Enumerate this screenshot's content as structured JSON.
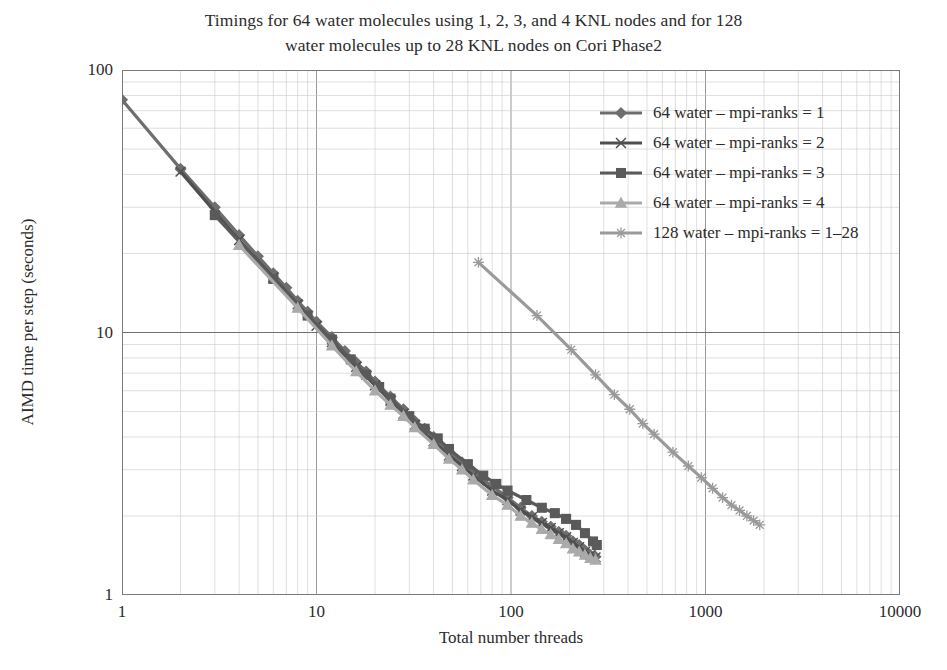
{
  "chart_data": {
    "type": "line",
    "title": "Timings for 64 water molecules using 1, 2, 3, and 4 KNL nodes and for 128 water molecules up to 28 KNL nodes on Cori Phase2",
    "title_line1": "Timings for 64 water molecules using 1, 2, 3, and 4 KNL nodes and for 128",
    "title_line2": "water molecules up to 28 KNL nodes on Cori Phase2",
    "xlabel": "Total number threads",
    "ylabel": "AIMD time per step (seconds)",
    "xscale": "log",
    "yscale": "log",
    "xlim": [
      1,
      10000
    ],
    "ylim": [
      1,
      100
    ],
    "xticks": [
      "1",
      "10",
      "100",
      "1000",
      "10000"
    ],
    "xtick_values": [
      1,
      10,
      100,
      1000,
      10000
    ],
    "yticks": [
      "1",
      "10",
      "100"
    ],
    "ytick_values": [
      1,
      10,
      100
    ],
    "grid": "major and minor gridlines on both axes",
    "legend_position": "upper right inside plot",
    "series": [
      {
        "name": "64 water – mpi-ranks = 1",
        "marker": "diamond",
        "color": "#6e6e6e",
        "points": [
          [
            1,
            77
          ],
          [
            2,
            42
          ],
          [
            3,
            30
          ],
          [
            4,
            23.5
          ],
          [
            5,
            19.5
          ],
          [
            6,
            16.8
          ],
          [
            7,
            14.8
          ],
          [
            8,
            13.2
          ],
          [
            9,
            12.0
          ],
          [
            10,
            11.0
          ],
          [
            12,
            9.6
          ],
          [
            14,
            8.5
          ],
          [
            16,
            7.7
          ],
          [
            18,
            7.1
          ],
          [
            20,
            6.5
          ],
          [
            24,
            5.7
          ],
          [
            28,
            5.1
          ],
          [
            32,
            4.6
          ],
          [
            36,
            4.3
          ],
          [
            40,
            4.0
          ],
          [
            48,
            3.5
          ],
          [
            56,
            3.2
          ],
          [
            64,
            2.95
          ],
          [
            72,
            2.75
          ],
          [
            80,
            2.6
          ],
          [
            96,
            2.35
          ],
          [
            112,
            2.15
          ],
          [
            128,
            2.0
          ],
          [
            144,
            1.9
          ],
          [
            160,
            1.82
          ],
          [
            176,
            1.74
          ],
          [
            192,
            1.68
          ],
          [
            208,
            1.6
          ],
          [
            224,
            1.55
          ],
          [
            240,
            1.48
          ],
          [
            256,
            1.42
          ],
          [
            272,
            1.4
          ]
        ]
      },
      {
        "name": "64 water – mpi-ranks = 2",
        "marker": "x-cross",
        "color": "#4f4f4f",
        "points": [
          [
            2,
            41
          ],
          [
            4,
            22.5
          ],
          [
            6,
            16.2
          ],
          [
            8,
            12.8
          ],
          [
            10,
            10.6
          ],
          [
            12,
            9.2
          ],
          [
            16,
            7.4
          ],
          [
            20,
            6.3
          ],
          [
            24,
            5.5
          ],
          [
            28,
            4.9
          ],
          [
            32,
            4.45
          ],
          [
            40,
            3.85
          ],
          [
            48,
            3.4
          ],
          [
            56,
            3.1
          ],
          [
            64,
            2.85
          ],
          [
            80,
            2.5
          ],
          [
            96,
            2.3
          ],
          [
            112,
            2.1
          ],
          [
            128,
            1.98
          ],
          [
            144,
            1.88
          ],
          [
            160,
            1.8
          ],
          [
            176,
            1.72
          ],
          [
            192,
            1.66
          ],
          [
            208,
            1.58
          ],
          [
            224,
            1.52
          ],
          [
            240,
            1.46
          ],
          [
            256,
            1.42
          ],
          [
            272,
            1.39
          ]
        ]
      },
      {
        "name": "64 water – mpi-ranks = 3",
        "marker": "square",
        "color": "#5a5a5a",
        "points": [
          [
            3,
            28
          ],
          [
            6,
            16.0
          ],
          [
            9,
            11.6
          ],
          [
            12,
            9.4
          ],
          [
            15,
            7.9
          ],
          [
            18,
            6.9
          ],
          [
            21,
            6.2
          ],
          [
            24,
            5.6
          ],
          [
            30,
            4.8
          ],
          [
            36,
            4.3
          ],
          [
            42,
            3.95
          ],
          [
            48,
            3.6
          ],
          [
            60,
            3.15
          ],
          [
            72,
            2.85
          ],
          [
            84,
            2.65
          ],
          [
            96,
            2.5
          ],
          [
            120,
            2.3
          ],
          [
            144,
            2.15
          ],
          [
            168,
            2.05
          ],
          [
            192,
            1.95
          ],
          [
            216,
            1.85
          ],
          [
            240,
            1.72
          ],
          [
            264,
            1.6
          ],
          [
            276,
            1.55
          ]
        ]
      },
      {
        "name": "64 water – mpi-ranks = 4",
        "marker": "triangle",
        "color": "#aaaaaa",
        "points": [
          [
            4,
            21.5
          ],
          [
            8,
            12.4
          ],
          [
            12,
            8.9
          ],
          [
            16,
            7.1
          ],
          [
            20,
            6.0
          ],
          [
            24,
            5.3
          ],
          [
            28,
            4.8
          ],
          [
            32,
            4.35
          ],
          [
            40,
            3.75
          ],
          [
            48,
            3.3
          ],
          [
            56,
            3.0
          ],
          [
            64,
            2.75
          ],
          [
            80,
            2.4
          ],
          [
            96,
            2.2
          ],
          [
            112,
            2.0
          ],
          [
            128,
            1.88
          ],
          [
            144,
            1.78
          ],
          [
            160,
            1.7
          ],
          [
            176,
            1.63
          ],
          [
            192,
            1.57
          ],
          [
            208,
            1.5
          ],
          [
            224,
            1.46
          ],
          [
            240,
            1.42
          ],
          [
            256,
            1.38
          ],
          [
            272,
            1.36
          ]
        ]
      },
      {
        "name": "128 water – mpi-ranks = 1–28",
        "marker": "star",
        "color": "#9a9a9a",
        "points": [
          [
            68,
            18.5
          ],
          [
            136,
            11.6
          ],
          [
            204,
            8.6
          ],
          [
            272,
            6.9
          ],
          [
            340,
            5.8
          ],
          [
            408,
            5.1
          ],
          [
            476,
            4.5
          ],
          [
            544,
            4.1
          ],
          [
            680,
            3.5
          ],
          [
            816,
            3.1
          ],
          [
            952,
            2.8
          ],
          [
            1088,
            2.55
          ],
          [
            1224,
            2.35
          ],
          [
            1360,
            2.2
          ],
          [
            1496,
            2.1
          ],
          [
            1632,
            2.0
          ],
          [
            1768,
            1.92
          ],
          [
            1900,
            1.85
          ]
        ]
      }
    ]
  },
  "legend": {
    "items": [
      {
        "label": "64 water – mpi-ranks = 1"
      },
      {
        "label": "64 water – mpi-ranks = 2"
      },
      {
        "label": "64 water – mpi-ranks = 3"
      },
      {
        "label": "64 water – mpi-ranks = 4"
      },
      {
        "label": "128 water – mpi-ranks = 1–28"
      }
    ]
  }
}
